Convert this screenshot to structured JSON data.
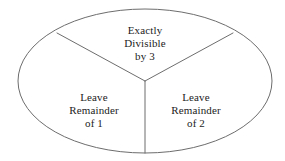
{
  "diagram": {
    "type": "ellipse-partition",
    "background_color": "#ffffff",
    "stroke_color": "#6d6d6d",
    "text_color": "#1c1c1c",
    "ellipse": {
      "cx": 145,
      "cy": 81,
      "rx": 127,
      "ry": 72
    },
    "junction": {
      "x": 145,
      "y": 81
    },
    "dividers": [
      {
        "name": "divider-upper-left",
        "x1": 145,
        "y1": 81,
        "x2": 57,
        "y2": 33
      },
      {
        "name": "divider-upper-right",
        "x1": 145,
        "y1": 81,
        "x2": 233,
        "y2": 33
      },
      {
        "name": "divider-bottom",
        "x1": 145,
        "y1": 81,
        "x2": 145,
        "y2": 153
      }
    ],
    "regions": [
      {
        "id": "divisible",
        "position": "top",
        "lines": [
          "Exactly",
          "Divisible",
          "by 3"
        ]
      },
      {
        "id": "remainder-1",
        "position": "bottom-left",
        "lines": [
          "Leave",
          "Remainder",
          "of 1"
        ]
      },
      {
        "id": "remainder-2",
        "position": "bottom-right",
        "lines": [
          "Leave",
          "Remainder",
          "of 2"
        ]
      }
    ]
  }
}
